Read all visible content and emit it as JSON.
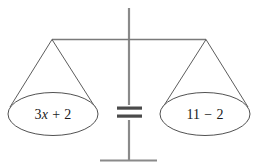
{
  "figure": {
    "left_pan": {
      "expression": "3x + 2",
      "coefficient": "3",
      "variable": "x",
      "operator": "+",
      "constant": "2"
    },
    "right_pan": {
      "expression": "11 − 2",
      "first_term": "11",
      "operator": "−",
      "second_term": "2"
    },
    "relation": "=",
    "colors": {
      "ink": "#1a1a1a",
      "line": "#6e6e6e",
      "equals": "#4a4a4a",
      "background": "#ffffff"
    }
  }
}
